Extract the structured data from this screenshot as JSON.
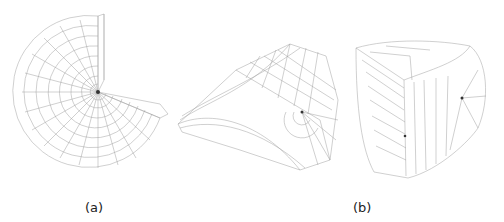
{
  "figure": {
    "panels": [
      {
        "id": "a",
        "label": "(a)",
        "description": "Three-quarter cylindrical wireframe mesh with polar grid converging at a central node"
      },
      {
        "id": "b",
        "label": "(b)",
        "description": "Two rotated views of a half-cylinder / wedge wireframe mesh"
      }
    ],
    "colors": {
      "mesh_line": "#9a9a9a",
      "node": "#333333",
      "background": "#ffffff"
    }
  }
}
